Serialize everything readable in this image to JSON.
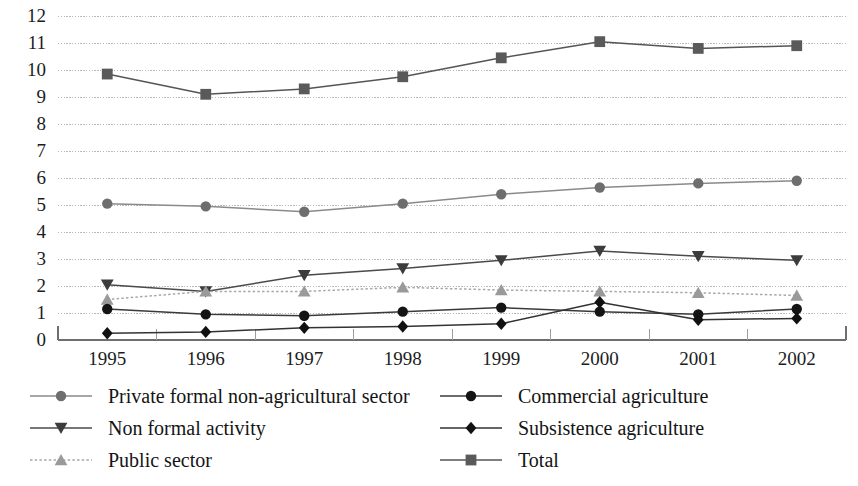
{
  "chart_data": {
    "type": "line",
    "title": "",
    "subtitle": "",
    "xlabel": "",
    "ylabel": "",
    "xlim_categories": [
      "1995",
      "1996",
      "1997",
      "1998",
      "1999",
      "2000",
      "2001",
      "2002"
    ],
    "ylim": [
      0,
      12
    ],
    "y_ticks": [
      0,
      1,
      2,
      3,
      4,
      5,
      6,
      7,
      8,
      9,
      10,
      11,
      12
    ],
    "y_tick_labels": [
      "0",
      "1",
      "2",
      "3",
      "4",
      "5",
      "6",
      "7",
      "8",
      "9",
      "10",
      "11",
      "12"
    ],
    "grid": true,
    "grid_axis": "y",
    "legend_position": "bottom",
    "legend_columns": 2,
    "categories": [
      "1995",
      "1996",
      "1997",
      "1998",
      "1999",
      "2000",
      "2001",
      "2002"
    ],
    "series": [
      {
        "name": "Private formal non-agricultural sector",
        "marker": "circle",
        "color": "#6e6e6e",
        "line_color": "#8a8a8a",
        "values": [
          5.05,
          4.95,
          4.75,
          5.05,
          5.4,
          5.65,
          5.8,
          5.9
        ]
      },
      {
        "name": "Non formal activity",
        "marker": "triangle-down",
        "color": "#3c3c3c",
        "line_color": "#4a4a4a",
        "values": [
          2.05,
          1.8,
          2.4,
          2.65,
          2.95,
          3.3,
          3.1,
          2.95
        ]
      },
      {
        "name": "Public sector",
        "marker": "triangle-up",
        "color": "#9a9a9a",
        "line_color": "#a8a8a8",
        "values": [
          1.5,
          1.8,
          1.8,
          1.95,
          1.85,
          1.8,
          1.75,
          1.65
        ]
      },
      {
        "name": "Commercial agriculture",
        "marker": "circle",
        "color": "#141414",
        "line_color": "#3a3a3a",
        "values": [
          1.15,
          0.95,
          0.9,
          1.05,
          1.2,
          1.05,
          0.95,
          1.15
        ]
      },
      {
        "name": "Subsistence agriculture",
        "marker": "diamond",
        "color": "#111111",
        "line_color": "#333333",
        "values": [
          0.25,
          0.3,
          0.45,
          0.5,
          0.6,
          1.4,
          0.75,
          0.8
        ]
      },
      {
        "name": "Total",
        "marker": "square",
        "color": "#5a5a5a",
        "line_color": "#555555",
        "values": [
          9.85,
          9.1,
          9.3,
          9.75,
          10.45,
          11.05,
          10.8,
          10.9
        ]
      }
    ]
  },
  "axis": {
    "y_labels": [
      "12",
      "11",
      "10",
      "9",
      "8",
      "7",
      "6",
      "5",
      "4",
      "3",
      "2",
      "1",
      "0"
    ],
    "x_labels": [
      "1995",
      "1996",
      "1997",
      "1998",
      "1999",
      "2000",
      "2001",
      "2002"
    ]
  },
  "legend": {
    "left_column": [
      {
        "label": "Private formal non-agricultural sector",
        "marker": "circle-marker",
        "color": "#6e6e6e",
        "line": "#8a8a8a",
        "dashed": false
      },
      {
        "label": "Non formal activity",
        "marker": "triangle-down-marker",
        "color": "#3c3c3c",
        "line": "#4a4a4a",
        "dashed": false
      },
      {
        "label": "Public sector",
        "marker": "triangle-up-marker",
        "color": "#9a9a9a",
        "line": "#a8a8a8",
        "dashed": true
      }
    ],
    "right_column": [
      {
        "label": "Commercial agriculture",
        "marker": "circle-marker",
        "color": "#141414",
        "line": "#3a3a3a",
        "dashed": false
      },
      {
        "label": "Subsistence agriculture",
        "marker": "diamond-marker",
        "color": "#111111",
        "line": "#333333",
        "dashed": false
      },
      {
        "label": "Total",
        "marker": "square-marker",
        "color": "#5a5a5a",
        "line": "#555555",
        "dashed": false
      }
    ]
  },
  "colors": {
    "background": "#ffffff",
    "grid": "#b9b9b9",
    "axis": "#6f6f6f",
    "text": "#1a1a1a"
  }
}
